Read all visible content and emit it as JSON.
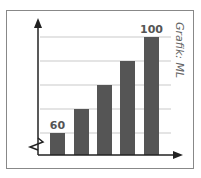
{
  "chart_data": {
    "type": "bar",
    "categories": [
      "1",
      "2",
      "3",
      "4",
      "5"
    ],
    "values": [
      60,
      70,
      80,
      90,
      100
    ],
    "data_labels": {
      "first": "60",
      "last": "100"
    },
    "title": "",
    "xlabel": "",
    "ylabel": "",
    "ylim": [
      50,
      100
    ],
    "axis_break": true,
    "grid": true,
    "credit": "Grafik: ML",
    "bar_color": "#555555"
  }
}
